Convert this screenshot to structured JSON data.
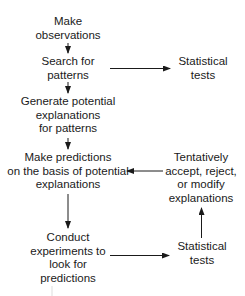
{
  "diagram": {
    "type": "flowchart",
    "nodes": {
      "observe": {
        "lines": [
          "Make",
          "observations"
        ]
      },
      "search": {
        "lines": [
          "Search for",
          "patterns"
        ]
      },
      "stats_top": {
        "lines": [
          "Statistical",
          "tests"
        ]
      },
      "generate": {
        "lines": [
          "Generate potential",
          "explanations",
          "for patterns"
        ]
      },
      "predict": {
        "lines": [
          "Make predictions",
          "on the basis of potential",
          "explanations"
        ]
      },
      "tentative": {
        "lines": [
          "Tentatively",
          "accept, reject,",
          "or modify",
          "explanations"
        ]
      },
      "conduct": {
        "lines": [
          "Conduct",
          "experiments to",
          "look for",
          "predictions"
        ]
      },
      "stats_bottom": {
        "lines": [
          "Statistical",
          "tests"
        ]
      }
    },
    "edges": [
      {
        "from": "observe",
        "to": "search"
      },
      {
        "from": "search",
        "to": "stats_top"
      },
      {
        "from": "search",
        "to": "generate"
      },
      {
        "from": "generate",
        "to": "predict"
      },
      {
        "from": "predict",
        "to": "conduct"
      },
      {
        "from": "conduct",
        "to": "stats_bottom"
      },
      {
        "from": "stats_bottom",
        "to": "tentative"
      },
      {
        "from": "tentative",
        "to": "predict"
      }
    ],
    "colors": {
      "text": "#1a1a1a",
      "arrow": "#1a1a1a",
      "background": "#ffffff"
    }
  }
}
